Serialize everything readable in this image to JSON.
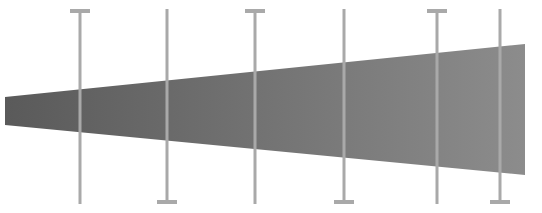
{
  "diagram": {
    "background": "#ffffff",
    "wedge": {
      "description": "tapered gray band widening left to right",
      "fill_left": "#5a5a5a",
      "fill_right": "#8c8c8c",
      "points": [
        [
          5,
          97
        ],
        [
          525,
          44
        ],
        [
          525,
          175
        ],
        [
          5,
          125
        ]
      ]
    },
    "rods": {
      "color": "#a9a9a9",
      "width": 3,
      "top_y": 9,
      "bottom_y": 204,
      "cap_width": 20,
      "cap_height": 4,
      "items": [
        {
          "x": 80,
          "cap": "top"
        },
        {
          "x": 167,
          "cap": "bottom"
        },
        {
          "x": 255,
          "cap": "top"
        },
        {
          "x": 344,
          "cap": "bottom"
        },
        {
          "x": 437,
          "cap": "top"
        },
        {
          "x": 500,
          "cap": "bottom"
        }
      ]
    }
  }
}
